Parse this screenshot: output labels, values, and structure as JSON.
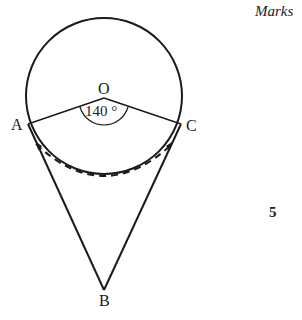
{
  "header": {
    "marks_label": "Marks"
  },
  "diagram": {
    "points": {
      "O": "O",
      "A": "A",
      "B": "B",
      "C": "C"
    },
    "angle_label": "140 °",
    "angle_value_deg": 140,
    "circle": {
      "cx": 104,
      "cy": 96,
      "r": 78
    },
    "stroke_color": "#1a1a1a"
  },
  "marks": {
    "value": "5"
  }
}
